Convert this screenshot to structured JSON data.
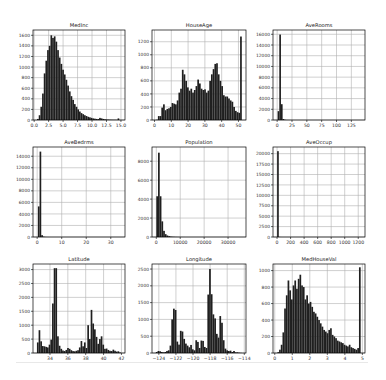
{
  "figure": {
    "background": "#ffffff",
    "bar_color": "#1f1f1f",
    "grid_color": "#b0b0b0",
    "frame_color": "#000000"
  },
  "chart_data": [
    {
      "type": "bar",
      "title": "MedInc",
      "xlabel": "",
      "ylabel": "",
      "xlim": [
        -0.2,
        15.7
      ],
      "ylim": [
        0,
        1700
      ],
      "xticks": [
        0.0,
        2.5,
        5.0,
        7.5,
        10.0,
        12.5,
        15.0
      ],
      "xtick_labels": [
        "0.0",
        "2.5",
        "5.0",
        "7.5",
        "10.0",
        "12.5",
        "15.0"
      ],
      "yticks": [
        0,
        200,
        400,
        600,
        800,
        1000,
        1200,
        1400,
        1600
      ],
      "bin_start": 0.5,
      "bin_width": 0.29,
      "values": [
        20,
        90,
        250,
        500,
        880,
        1120,
        1320,
        1400,
        1600,
        1550,
        1580,
        1480,
        1320,
        1180,
        1060,
        950,
        860,
        760,
        650,
        540,
        450,
        380,
        300,
        250,
        200,
        160,
        130,
        110,
        90,
        75,
        60,
        50,
        40,
        30,
        25,
        20,
        18,
        40,
        30,
        20,
        14,
        10,
        8,
        6,
        5,
        4,
        4,
        3,
        30,
        0
      ],
      "grid": true
    },
    {
      "type": "bar",
      "title": "HouseAge",
      "xlabel": "",
      "ylabel": "",
      "xlim": [
        -1.5,
        54.5
      ],
      "ylim": [
        0,
        1380
      ],
      "xticks": [
        0,
        10,
        20,
        30,
        40,
        50
      ],
      "xtick_labels": [
        "0",
        "10",
        "20",
        "30",
        "40",
        "50"
      ],
      "yticks": [
        0,
        200,
        400,
        600,
        800,
        1000,
        1200
      ],
      "bin_start": 1,
      "bin_width": 1.02,
      "values": [
        4,
        60,
        60,
        190,
        240,
        150,
        170,
        180,
        200,
        260,
        250,
        240,
        300,
        420,
        480,
        770,
        700,
        600,
        500,
        450,
        480,
        420,
        460,
        520,
        620,
        560,
        480,
        460,
        470,
        420,
        450,
        600,
        700,
        780,
        860,
        870,
        700,
        600,
        520,
        380,
        360,
        360,
        330,
        300,
        280,
        200,
        140,
        120,
        110,
        1280
      ],
      "grid": true
    },
    {
      "type": "bar",
      "title": "AveRooms",
      "xlabel": "",
      "ylabel": "",
      "xlim": [
        -7,
        148
      ],
      "ylim": [
        0,
        16800
      ],
      "xticks": [
        0,
        25,
        50,
        75,
        100,
        125
      ],
      "xtick_labels": [
        "0",
        "25",
        "50",
        "75",
        "100",
        "125"
      ],
      "yticks": [
        0,
        2000,
        4000,
        6000,
        8000,
        10000,
        12000,
        14000,
        16000
      ],
      "bin_start": 0.8,
      "bin_width": 2.8,
      "values": [
        1650,
        15950,
        2950,
        180,
        40,
        12,
        5,
        3,
        2,
        1
      ],
      "grid": true
    },
    {
      "type": "bar",
      "title": "AveBedrms",
      "xlabel": "",
      "ylabel": "",
      "xlim": [
        -1.7,
        35.8
      ],
      "ylim": [
        0,
        15600
      ],
      "xticks": [
        0,
        10,
        20,
        30
      ],
      "xtick_labels": [
        "0",
        "10",
        "20",
        "30"
      ],
      "yticks": [
        0,
        2000,
        4000,
        6000,
        8000,
        10000,
        12000,
        14000
      ],
      "bin_start": 0.3,
      "bin_width": 0.68,
      "values": [
        5300,
        14800,
        320,
        60,
        15,
        5,
        3,
        2
      ],
      "grid": true
    },
    {
      "type": "bar",
      "title": "Population",
      "xlabel": "",
      "ylabel": "",
      "xlim": [
        -1800,
        37500
      ],
      "ylim": [
        0,
        9500
      ],
      "xticks": [
        0,
        10000,
        20000,
        30000
      ],
      "xtick_labels": [
        "0",
        "10000",
        "20000",
        "30000"
      ],
      "yticks": [
        0,
        2000,
        4000,
        6000,
        8000
      ],
      "bin_start": 3,
      "bin_width": 714,
      "values": [
        4300,
        8900,
        4300,
        1650,
        650,
        300,
        160,
        90,
        50,
        30,
        20,
        12,
        8,
        5,
        4,
        3,
        2
      ],
      "grid": true
    },
    {
      "type": "bar",
      "title": "AveOccup",
      "xlabel": "",
      "ylabel": "",
      "xlim": [
        -60,
        1300
      ],
      "ylim": [
        0,
        21600
      ],
      "xticks": [
        0,
        200,
        400,
        600,
        800,
        1000,
        1200
      ],
      "xtick_labels": [
        "0",
        "200",
        "400",
        "600",
        "800",
        "1000",
        "1200"
      ],
      "yticks": [
        0,
        2500,
        5000,
        7500,
        10000,
        12500,
        15000,
        17500,
        20000
      ],
      "bin_start": 0.7,
      "bin_width": 24.8,
      "values": [
        20600,
        20,
        5,
        2,
        1
      ],
      "grid": true
    },
    {
      "type": "bar",
      "title": "Latitude",
      "xlabel": "",
      "ylabel": "",
      "xlim": [
        32.1,
        42.4
      ],
      "ylim": [
        0,
        3200
      ],
      "xticks": [
        34,
        36,
        38,
        40,
        42
      ],
      "xtick_labels": [
        "34",
        "36",
        "38",
        "40",
        "42"
      ],
      "yticks": [
        0,
        500,
        1000,
        1500,
        2000,
        2500,
        3000
      ],
      "bin_start": 32.54,
      "bin_width": 0.188,
      "values": [
        380,
        820,
        420,
        250,
        240,
        220,
        200,
        300,
        480,
        1780,
        3050,
        3050,
        600,
        260,
        150,
        90,
        70,
        110,
        180,
        150,
        100,
        70,
        60,
        80,
        100,
        200,
        430,
        240,
        380,
        180,
        1000,
        500,
        1550,
        1060,
        850,
        580,
        330,
        500,
        600,
        300,
        150,
        160,
        110,
        80,
        70,
        120,
        80,
        50,
        60,
        20
      ],
      "grid": true
    },
    {
      "type": "bar",
      "title": "Longitude",
      "xlabel": "",
      "ylabel": "",
      "xlim": [
        -124.8,
        -113.8
      ],
      "ylim": [
        0,
        2650
      ],
      "xticks": [
        -124,
        -122,
        -120,
        -118,
        -116,
        -114
      ],
      "xtick_labels": [
        "−124",
        "−122",
        "−120",
        "−118",
        "−116",
        "−114"
      ],
      "yticks": [
        0,
        500,
        1000,
        1500,
        2000,
        2500
      ],
      "bin_start": -124.35,
      "bin_width": 0.201,
      "values": [
        30,
        60,
        50,
        30,
        20,
        30,
        60,
        80,
        220,
        1000,
        1320,
        1280,
        340,
        250,
        660,
        640,
        420,
        280,
        220,
        170,
        240,
        110,
        80,
        380,
        330,
        150,
        370,
        360,
        180,
        150,
        1740,
        2500,
        1750,
        1150,
        1030,
        570,
        460,
        1100,
        900,
        380,
        130,
        80,
        60,
        70,
        30,
        60,
        20,
        20,
        10,
        5
      ],
      "grid": true
    },
    {
      "type": "bar",
      "title": "MedHouseVal",
      "xlabel": "",
      "ylabel": "",
      "xlim": [
        -0.1,
        5.15
      ],
      "ylim": [
        0,
        1080
      ],
      "xticks": [
        0,
        1,
        2,
        3,
        4,
        5
      ],
      "xtick_labels": [
        "0",
        "1",
        "2",
        "3",
        "4",
        "5"
      ],
      "yticks": [
        0,
        200,
        400,
        600,
        800,
        1000
      ],
      "bin_start": 0.15,
      "bin_width": 0.097,
      "values": [
        10,
        40,
        100,
        250,
        540,
        700,
        880,
        760,
        650,
        820,
        880,
        780,
        900,
        950,
        820,
        800,
        650,
        700,
        600,
        620,
        560,
        500,
        480,
        440,
        400,
        360,
        320,
        280,
        260,
        240,
        280,
        300,
        220,
        200,
        180,
        150,
        140,
        130,
        120,
        100,
        90,
        80,
        100,
        70,
        60,
        50,
        40,
        60,
        1040,
        0
      ],
      "grid": true
    }
  ]
}
